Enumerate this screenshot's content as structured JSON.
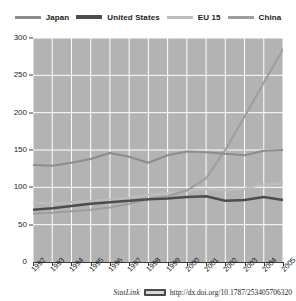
{
  "legend": {
    "position": "top-center",
    "items": [
      {
        "label": "Japan",
        "color": "#8c8c8c",
        "width": 3
      },
      {
        "label": "United States",
        "color": "#4d4d4d",
        "width": 4
      },
      {
        "label": "EU 15",
        "color": "#bdbdbd",
        "width": 3
      },
      {
        "label": "China",
        "color": "#9e9e9e",
        "width": 3
      }
    ]
  },
  "axes": {
    "y_ticks": [
      "0",
      "50",
      "100",
      "150",
      "200",
      "250",
      "300"
    ],
    "x_ticks": [
      "1992",
      "1993",
      "1994",
      "1995",
      "1996",
      "1997",
      "1998",
      "1999",
      "2000",
      "2001",
      "2002",
      "2003",
      "2004",
      "2005"
    ]
  },
  "footer": {
    "statlink_label": "StatLink",
    "badge_name": "statlink-logo",
    "url": "http://dx.doi.org/10.1787/253405706320"
  },
  "colors": {
    "plot_background": "#b3b3b3",
    "gridline": "#ffffff",
    "axis": "#3a3a3a",
    "page_background": "#ffffff"
  },
  "chart_data": {
    "type": "line",
    "title": "",
    "subtitle": "",
    "xlabel": "",
    "ylabel": "",
    "x": [
      1992,
      1993,
      1994,
      1995,
      1996,
      1997,
      1998,
      1999,
      2000,
      2001,
      2002,
      2003,
      2004,
      2005
    ],
    "categories": [
      "1992",
      "1993",
      "1994",
      "1995",
      "1996",
      "1997",
      "1998",
      "1999",
      "2000",
      "2001",
      "2002",
      "2003",
      "2004",
      "2005"
    ],
    "xlim": [
      1992,
      2005
    ],
    "ylim": [
      0,
      300
    ],
    "y_tick_step": 50,
    "grid": true,
    "legend_position": "top",
    "series": [
      {
        "name": "Japan",
        "color": "#8c8c8c",
        "values": [
          130,
          129,
          133,
          138,
          146,
          141,
          133,
          143,
          148,
          147,
          145,
          143,
          149,
          150
        ]
      },
      {
        "name": "United States",
        "color": "#4d4d4d",
        "values": [
          70,
          72,
          75,
          78,
          80,
          82,
          84,
          85,
          87,
          88,
          82,
          83,
          87,
          83
        ]
      },
      {
        "name": "EU 15",
        "color": "#bdbdbd",
        "values": [
          80,
          78,
          80,
          82,
          84,
          86,
          90,
          92,
          95,
          98,
          96,
          98,
          104,
          105
        ]
      },
      {
        "name": "China",
        "color": "#9e9e9e",
        "values": [
          65,
          66,
          68,
          70,
          73,
          78,
          84,
          88,
          96,
          112,
          150,
          195,
          240,
          285
        ]
      }
    ]
  }
}
